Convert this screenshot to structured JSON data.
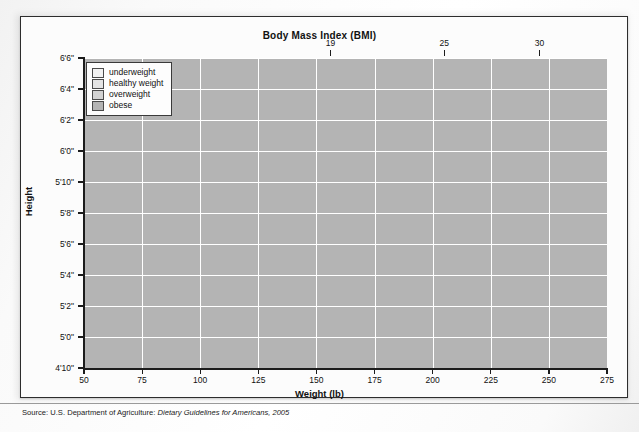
{
  "figure": {
    "title": "Body Mass Index (BMI)",
    "xlabel": "Weight (lb)",
    "ylabel": "Height",
    "source_prefix": "Source: U.S. Department of Agriculture: ",
    "source_italic": "Dietary Guidelines for Americans, 2005"
  },
  "legend": {
    "items": [
      {
        "label": "underweight",
        "color": "#f2f2f2"
      },
      {
        "label": "healthy weight",
        "color": "#e4e4e4"
      },
      {
        "label": "overweight",
        "color": "#d2d2d2"
      },
      {
        "label": "obese",
        "color": "#b4b4b4"
      }
    ]
  },
  "chart_data": {
    "type": "area",
    "title": "Body Mass Index (BMI)",
    "xlabel": "Weight (lb)",
    "ylabel": "Height",
    "xlim": [
      50,
      275
    ],
    "ylim_inches": [
      58,
      78
    ],
    "grid": true,
    "legend_position": "top-left inside plot",
    "x_ticks": [
      50,
      75,
      100,
      125,
      150,
      175,
      200,
      225,
      250,
      275
    ],
    "x_tick_labels": [
      "50",
      "75",
      "100",
      "125",
      "150",
      "175",
      "200",
      "225",
      "250",
      "275"
    ],
    "y_ticks_inches": [
      58,
      60,
      62,
      64,
      66,
      68,
      70,
      72,
      74,
      76,
      78
    ],
    "y_tick_labels": [
      "4'10\"",
      "5'0\"",
      "5'2\"",
      "5'4\"",
      "5'6\"",
      "5'8\"",
      "5'10\"",
      "6'0\"",
      "6'2\"",
      "6'4\"",
      "6'6\""
    ],
    "top_axis_label": "Body Mass Index (BMI)",
    "top_ticks": [
      19,
      25,
      30
    ],
    "top_tick_labels": [
      "19",
      "25",
      "30"
    ],
    "top_tick_weights_at_max_height": [
      156,
      205,
      246
    ],
    "bands": [
      {
        "name": "underweight",
        "bmi_range": [
          0,
          19
        ],
        "color": "#f2f2f2",
        "boundary_weights_lb": {
          "at_4ft10in": 91,
          "at_6ft6in": 156
        }
      },
      {
        "name": "healthy weight",
        "bmi_range": [
          19,
          25
        ],
        "color": "#e4e4e4",
        "boundary_weights_lb": {
          "at_4ft10in": 120,
          "at_6ft6in": 205
        }
      },
      {
        "name": "overweight",
        "bmi_range": [
          25,
          30
        ],
        "color": "#d2d2d2",
        "boundary_weights_lb": {
          "at_4ft10in": 144,
          "at_6ft6in": 246
        }
      },
      {
        "name": "obese",
        "bmi_range": [
          30,
          null
        ],
        "color": "#b4b4b4",
        "boundary_weights_lb": {
          "at_4ft10in": 144,
          "at_6ft6in": 246
        }
      }
    ]
  }
}
